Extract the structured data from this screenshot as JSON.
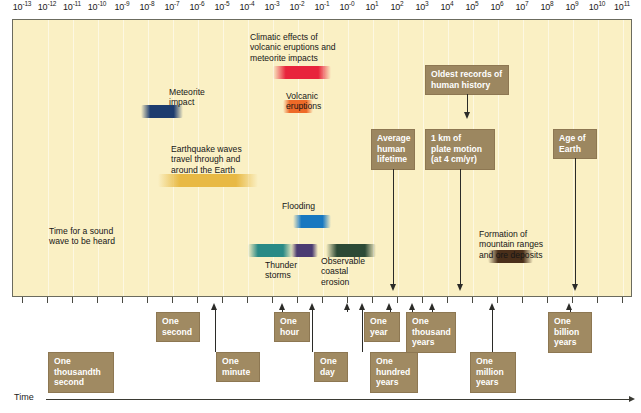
{
  "figure": {
    "axis_label": "Time",
    "axis_min_exponent": -13,
    "axis_max_exponent": 11
  },
  "axis": {
    "base": "10",
    "exponents": [
      "-13",
      "-12",
      "-11",
      "-10",
      "-9",
      "-8",
      "-7",
      "-6",
      "-5",
      "-4",
      "-3",
      "-2",
      "-1",
      "-0",
      "1",
      "2",
      "3",
      "4",
      "5",
      "6",
      "7",
      "8",
      "9",
      "10",
      "11"
    ]
  },
  "chart_data": {
    "type": "timeline",
    "xlabel": "Time",
    "xscale": "log10 seconds",
    "xlim": [
      -13,
      11
    ],
    "grid": true,
    "legend": "none",
    "bars": [
      {
        "label": "Time for a sound\nwave to be heard",
        "color": "#2a8a86",
        "start_exponent": -4.0,
        "end_exponent": -2.2,
        "label_position": "above"
      },
      {
        "label": "Meteorite\nimpact",
        "color": "#1d3c6e",
        "start_exponent": -8.3,
        "end_exponent": -6.6,
        "label_position": "above"
      },
      {
        "label": "Earthquake waves\ntravel through and\naround the Earth",
        "color": "#e8b944",
        "start_exponent": -7.6,
        "end_exponent": -3.6,
        "label_position": "above"
      },
      {
        "label": "Climatic effects of\nvolcanic eruptions and\nmeteorite impacts",
        "color": "#e8243c",
        "start_exponent": -3.0,
        "end_exponent": -0.7,
        "label_position": "above"
      },
      {
        "label": "Volcanic\neruptions",
        "color": "#ee6a28",
        "start_exponent": -2.6,
        "end_exponent": -1.4,
        "label_position": "above"
      },
      {
        "label": "Flooding",
        "color": "#1878c0",
        "start_exponent": -2.2,
        "end_exponent": -0.7,
        "label_position": "above"
      },
      {
        "label": "Thunder\nstorms",
        "color": "#4b3c72",
        "start_exponent": -2.3,
        "end_exponent": -1.2,
        "label_position": "below"
      },
      {
        "label": "Observable\ncoastal\nerosion",
        "color": "#2c4a36",
        "start_exponent": -0.9,
        "end_exponent": 1.1,
        "label_position": "below"
      },
      {
        "label": "Formation of\nmountain ranges\nand ore deposits",
        "color": "#4a2f1a",
        "start_exponent": 5.6,
        "end_exponent": 7.4,
        "label_position": "above"
      }
    ],
    "markers": [
      {
        "label": "Average\nhuman\nlifetime",
        "exponent": 2.2
      },
      {
        "label": "Oldest records of\nhuman history",
        "exponent": 4.2
      },
      {
        "label": "1 km of\nplate motion\n(at 4 cm/yr)",
        "exponent": 4.2
      },
      {
        "label": "Age of\nEarth",
        "exponent": 9.3
      }
    ],
    "time_scale_markers": [
      {
        "label": "One\nthousandth\nsecond",
        "exponent": -5.3
      },
      {
        "label": "One\nsecond",
        "exponent": -2.6
      },
      {
        "label": "One\nminute",
        "exponent": -1.4
      },
      {
        "label": "One\nhour",
        "exponent": 0.0
      },
      {
        "label": "One\nday",
        "exponent": 0.6
      },
      {
        "label": "One\nyear",
        "exponent": 1.7
      },
      {
        "label": "One\nhundred\nyears",
        "exponent": 2.6
      },
      {
        "label": "One\nthousand\nyears",
        "exponent": 3.4
      },
      {
        "label": "One\nmillion\nyears",
        "exponent": 5.8
      },
      {
        "label": "One\nbillion\nyears",
        "exponent": 8.9
      }
    ]
  },
  "colors": {
    "plot_background": "#faf0c4",
    "gridline": "#fdf8e2",
    "box_fill": "#a08a62",
    "box_text": "#ffffff",
    "frame": "#6b6b5e",
    "arrow": "#2b2b28"
  }
}
